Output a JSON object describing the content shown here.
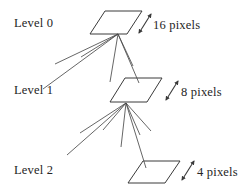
{
  "figure": {
    "background_color": "#ffffff",
    "stroke_color": "#3a3a3a",
    "text_color": "#252525"
  },
  "levels": [
    {
      "id": "level-0",
      "label": "Level 0",
      "size_label": "16 pixels",
      "tile_icon": "parallelogram-icon",
      "arrow_icon": "double-arrow-diagonal-icon"
    },
    {
      "id": "level-1",
      "label": "Level 1",
      "size_label": "8 pixels",
      "tile_icon": "parallelogram-icon",
      "arrow_icon": "double-arrow-diagonal-icon"
    },
    {
      "id": "level-2",
      "label": "Level 2",
      "size_label": "4 pixels",
      "tile_icon": "parallelogram-icon",
      "arrow_icon": "double-arrow-diagonal-icon"
    }
  ],
  "connectors": {
    "fan_from_level_0": {
      "apex": [
        118,
        34
      ],
      "endpoints": [
        [
          43,
          89
        ],
        [
          55,
          64
        ],
        [
          81,
          57
        ],
        [
          110,
          82
        ],
        [
          133,
          66
        ],
        [
          139,
          83
        ]
      ]
    },
    "fan_from_level_1": {
      "apex": [
        126,
        103
      ],
      "endpoints": [
        [
          67,
          154
        ],
        [
          80,
          133
        ],
        [
          103,
          130
        ],
        [
          121,
          146
        ],
        [
          140,
          135
        ],
        [
          151,
          131
        ],
        [
          145,
          167
        ]
      ]
    }
  }
}
